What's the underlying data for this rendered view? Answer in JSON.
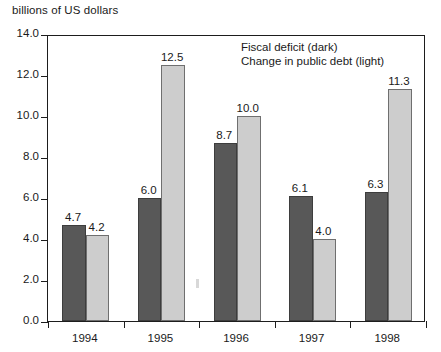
{
  "caption": "billions of US dollars",
  "legend": {
    "entries": [
      "Fiscal deficit (dark)",
      "Change in public debt (light)"
    ]
  },
  "axes": {
    "y_ticks": [
      "0.0",
      "2.0",
      "4.0",
      "6.0",
      "8.0",
      "10.0",
      "12.0",
      "14.0"
    ],
    "x_ticks": [
      "1994",
      "1995",
      "1996",
      "1997",
      "1998"
    ]
  },
  "colors": {
    "dark_bar": "#585858",
    "light_bar": "#cdcdcd",
    "axis": "#1d1d1d",
    "text": "#1a1a1a",
    "background": "#ffffff"
  },
  "values": {
    "v1994_dark": "4.7",
    "v1994_light": "4.2",
    "v1995_dark": "6.0",
    "v1995_light": "12.5",
    "v1996_dark": "8.7",
    "v1996_light": "10.0",
    "v1997_dark": "6.1",
    "v1997_light": "4.0",
    "v1998_dark": "6.3",
    "v1998_light": "11.3"
  },
  "chart_data": {
    "type": "bar",
    "title": "",
    "subtitle": "",
    "xlabel": "",
    "ylabel": "billions of US dollars",
    "categories": [
      "1994",
      "1995",
      "1996",
      "1997",
      "1998"
    ],
    "series": [
      {
        "name": "Fiscal deficit (dark)",
        "color": "#585858",
        "values": [
          4.7,
          6.0,
          8.7,
          6.1,
          6.3
        ],
        "labels": [
          "4.7",
          "6.0",
          "8.7",
          "6.1",
          "6.3"
        ]
      },
      {
        "name": "Change in public debt (light)",
        "color": "#cdcdcd",
        "values": [
          4.2,
          12.5,
          10.0,
          4.0,
          11.3
        ],
        "labels": [
          "4.2",
          "12.5",
          "10.0",
          "4.0",
          "11.3"
        ]
      }
    ],
    "ylim": [
      0,
      14
    ],
    "ytick_step": 2,
    "ytick_labels": [
      "0.0",
      "2.0",
      "4.0",
      "6.0",
      "8.0",
      "10.0",
      "12.0",
      "14.0"
    ],
    "grid": false,
    "legend_position": "inside-top-right",
    "data_labels": true,
    "bar_group_gap": true,
    "bars_adjacent_within_group": true
  }
}
